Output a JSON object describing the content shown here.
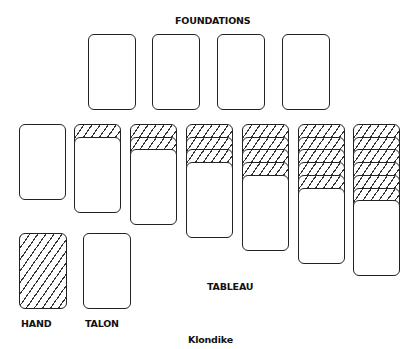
{
  "title": "Klondike",
  "labels": {
    "foundations": "FOUNDATIONS",
    "tableau": "TABLEAU",
    "hand": "HAND",
    "talon": "TALON",
    "game_name": "Klondike"
  },
  "foundations": [
    {
      "index": 1,
      "state": "empty"
    },
    {
      "index": 2,
      "state": "empty"
    },
    {
      "index": 3,
      "state": "empty"
    },
    {
      "index": 4,
      "state": "empty"
    }
  ],
  "tableau": [
    {
      "column": 1,
      "face_down": 0,
      "face_up": 1
    },
    {
      "column": 2,
      "face_down": 1,
      "face_up": 1
    },
    {
      "column": 3,
      "face_down": 2,
      "face_up": 1
    },
    {
      "column": 4,
      "face_down": 3,
      "face_up": 1
    },
    {
      "column": 5,
      "face_down": 4,
      "face_up": 1
    },
    {
      "column": 6,
      "face_down": 5,
      "face_up": 1
    },
    {
      "column": 7,
      "face_down": 6,
      "face_up": 1
    }
  ],
  "hand": {
    "state": "face_down"
  },
  "talon": {
    "state": "empty"
  },
  "colors": {
    "stroke": "#222222",
    "background": "#ffffff",
    "hatch": "#333333"
  }
}
